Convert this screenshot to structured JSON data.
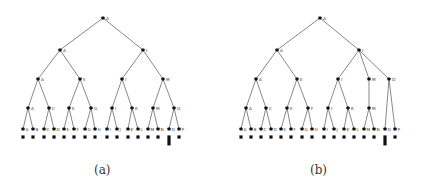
{
  "figure": {
    "panels": [
      {
        "id": "a",
        "caption": "(a)",
        "caption_pos": [
          103,
          174
        ],
        "nodes": [
          {
            "id": "r",
            "label": "A",
            "x": 103,
            "y": 18
          },
          {
            "id": "l1a",
            "label": "A",
            "x": 60,
            "y": 50
          },
          {
            "id": "l1b",
            "label": "I",
            "x": 143,
            "y": 50
          },
          {
            "id": "l2a",
            "label": "A",
            "x": 38,
            "y": 79
          },
          {
            "id": "l2b",
            "label": "E",
            "x": 80,
            "y": 79
          },
          {
            "id": "l2c",
            "label": "I",
            "x": 122,
            "y": 79
          },
          {
            "id": "l2d",
            "label": "M",
            "x": 163,
            "y": 79
          },
          {
            "id": "l3a",
            "label": "A",
            "x": 28,
            "y": 108
          },
          {
            "id": "l3b",
            "label": "C",
            "x": 49,
            "y": 108
          },
          {
            "id": "l3c",
            "label": "E",
            "x": 69,
            "y": 108
          },
          {
            "id": "l3d",
            "label": "G",
            "x": 91,
            "y": 108
          },
          {
            "id": "l3e",
            "label": "I",
            "x": 112,
            "y": 108
          },
          {
            "id": "l3f",
            "label": "K",
            "x": 132,
            "y": 108
          },
          {
            "id": "l3g",
            "label": "M",
            "x": 153,
            "y": 108
          },
          {
            "id": "l3h",
            "label": "O",
            "x": 174,
            "y": 108
          }
        ],
        "edges": [
          [
            "r",
            "l1a"
          ],
          [
            "r",
            "l1b"
          ],
          [
            "l1a",
            "l2a"
          ],
          [
            "l1a",
            "l2b"
          ],
          [
            "l1b",
            "l2c"
          ],
          [
            "l1b",
            "l2d"
          ],
          [
            "l2a",
            "l3a"
          ],
          [
            "l2a",
            "l3b"
          ],
          [
            "l2b",
            "l3c"
          ],
          [
            "l2b",
            "l3d"
          ],
          [
            "l2c",
            "l3e"
          ],
          [
            "l2c",
            "l3f"
          ],
          [
            "l2d",
            "l3g"
          ],
          [
            "l2d",
            "l3h"
          ]
        ],
        "leaves": [
          {
            "label": "A",
            "x": 23,
            "parent": "l3a"
          },
          {
            "label": "B",
            "x": 33,
            "parent": "l3a"
          },
          {
            "label": "C",
            "x": 44,
            "parent": "l3b"
          },
          {
            "label": "D",
            "x": 54,
            "parent": "l3b"
          },
          {
            "label": "E",
            "x": 64,
            "parent": "l3c"
          },
          {
            "label": "F",
            "x": 74,
            "parent": "l3c"
          },
          {
            "label": "G",
            "x": 85,
            "parent": "l3d"
          },
          {
            "label": "H",
            "x": 95,
            "parent": "l3d"
          },
          {
            "label": "I",
            "x": 107,
            "parent": "l3e"
          },
          {
            "label": "J",
            "x": 117,
            "parent": "l3e"
          },
          {
            "label": "K",
            "x": 128,
            "parent": "l3f"
          },
          {
            "label": "L",
            "x": 138,
            "parent": "l3f"
          },
          {
            "label": "M",
            "x": 148,
            "parent": "l3g"
          },
          {
            "label": "N",
            "x": 158,
            "parent": "l3g"
          },
          {
            "label": "O",
            "x": 169,
            "parent": "l3h",
            "tall": true
          },
          {
            "label": "P",
            "x": 179,
            "parent": "l3h"
          }
        ]
      },
      {
        "id": "b",
        "caption": "(b)",
        "caption_pos": [
          319,
          174
        ],
        "nodes": [
          {
            "id": "r",
            "label": "A",
            "x": 320,
            "y": 18
          },
          {
            "id": "l1a",
            "label": "A",
            "x": 277,
            "y": 50
          },
          {
            "id": "l1b",
            "label": "I",
            "x": 359,
            "y": 50
          },
          {
            "id": "l2a",
            "label": "A",
            "x": 256,
            "y": 79
          },
          {
            "id": "l2b",
            "label": "E",
            "x": 297,
            "y": 79
          },
          {
            "id": "l2c",
            "label": "I",
            "x": 338,
            "y": 79
          },
          {
            "id": "l2d",
            "label": "M",
            "x": 369,
            "y": 79
          },
          {
            "id": "l2e",
            "label": "O",
            "x": 389,
            "y": 79
          },
          {
            "id": "l3a",
            "label": "A",
            "x": 246,
            "y": 108
          },
          {
            "id": "l3b",
            "label": "C",
            "x": 266,
            "y": 108
          },
          {
            "id": "l3c",
            "label": "E",
            "x": 287,
            "y": 108
          },
          {
            "id": "l3d",
            "label": "F",
            "x": 308,
            "y": 108
          },
          {
            "id": "l3e",
            "label": "I",
            "x": 328,
            "y": 108
          },
          {
            "id": "l3f",
            "label": "K",
            "x": 348,
            "y": 108
          },
          {
            "id": "l3g",
            "label": "M",
            "x": 369,
            "y": 108
          }
        ],
        "edges": [
          [
            "r",
            "l1a"
          ],
          [
            "r",
            "l1b"
          ],
          [
            "l1a",
            "l2a"
          ],
          [
            "l1a",
            "l2b"
          ],
          [
            "l1b",
            "l2c"
          ],
          [
            "l1b",
            "l2d"
          ],
          [
            "l1b",
            "l2e"
          ],
          [
            "l2a",
            "l3a"
          ],
          [
            "l2a",
            "l3b"
          ],
          [
            "l2b",
            "l3c"
          ],
          [
            "l2b",
            "l3d"
          ],
          [
            "l2c",
            "l3e"
          ],
          [
            "l2c",
            "l3f"
          ],
          [
            "l2d",
            "l3g"
          ]
        ],
        "leaves": [
          {
            "label": "A",
            "x": 241,
            "parent": "l3a"
          },
          {
            "label": "B",
            "x": 251,
            "parent": "l3a"
          },
          {
            "label": "C",
            "x": 261,
            "parent": "l3b"
          },
          {
            "label": "D",
            "x": 271,
            "parent": "l3b"
          },
          {
            "label": "E",
            "x": 281,
            "parent": "l3c"
          },
          {
            "label": "F",
            "x": 291,
            "parent": "l3c"
          },
          {
            "label": "G",
            "x": 302,
            "parent": "l3d"
          },
          {
            "label": "H",
            "x": 312,
            "parent": "l3d"
          },
          {
            "label": "I",
            "x": 324,
            "parent": "l3e"
          },
          {
            "label": "J",
            "x": 334,
            "parent": "l3e"
          },
          {
            "label": "K",
            "x": 344,
            "parent": "l3f"
          },
          {
            "label": "L",
            "x": 354,
            "parent": "l3f"
          },
          {
            "label": "M",
            "x": 364,
            "parent": "l3g"
          },
          {
            "label": "N",
            "x": 374,
            "parent": "l3g"
          },
          {
            "label": "O",
            "x": 385,
            "parent": "l2e",
            "tall": true
          },
          {
            "label": "P",
            "x": 395,
            "parent": "l2e"
          }
        ]
      }
    ],
    "leaf_y": 129,
    "square_y": 137
  }
}
